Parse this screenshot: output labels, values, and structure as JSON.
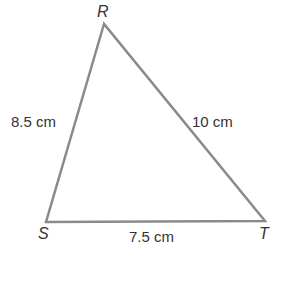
{
  "diagram": {
    "type": "triangle",
    "vertices": [
      {
        "name": "R",
        "x": 104,
        "y": 24
      },
      {
        "name": "S",
        "x": 46,
        "y": 222
      },
      {
        "name": "T",
        "x": 265,
        "y": 221
      }
    ],
    "sides": {
      "RS": "8.5 cm",
      "RT": "10 cm",
      "ST": "7.5 cm"
    },
    "stroke_color": "#8a8a8a"
  }
}
